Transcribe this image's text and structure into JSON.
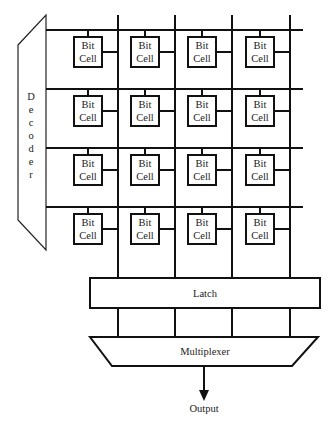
{
  "diagram": {
    "decoder": {
      "label": "Decoder",
      "letters": [
        "D",
        "e",
        "c",
        "o",
        "d",
        "e",
        "r"
      ]
    },
    "cells": {
      "label_line1": "Bit",
      "label_line2": "Cell",
      "rows": 4,
      "cols": 4
    },
    "latch": {
      "label": "Latch"
    },
    "multiplexer": {
      "label": "Multiplexer"
    },
    "output": {
      "label": "Output"
    }
  }
}
